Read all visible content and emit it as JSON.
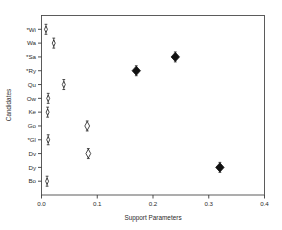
{
  "chart_data": {
    "type": "scatter",
    "title": "",
    "xlabel": "Support Parameters",
    "ylabel": "Candidates",
    "xlim": [
      0.0,
      0.4
    ],
    "grid": false,
    "legend": null,
    "xticks": [
      "0.0",
      "0.1",
      "0.2",
      "0.3",
      "0.4"
    ],
    "xtick_values": [
      0.0,
      0.1,
      0.2,
      0.3,
      0.4
    ],
    "categories": [
      "*Wi",
      "Wa",
      "*Sa",
      "*Ry",
      "Qu",
      "Ow",
      "Ke",
      "Go",
      "*Gl",
      "Dv",
      "Dy",
      "Bo"
    ],
    "points": [
      {
        "label": "*Wi",
        "value": 0.008,
        "low": 0.003,
        "high": 0.015,
        "marker": "open-small"
      },
      {
        "label": "Wa",
        "value": 0.022,
        "low": 0.016,
        "high": 0.03,
        "marker": "open-small"
      },
      {
        "label": "*Sa",
        "value": 0.24,
        "low": 0.232,
        "high": 0.249,
        "marker": "solid-diamond"
      },
      {
        "label": "*Ry",
        "value": 0.17,
        "low": 0.162,
        "high": 0.179,
        "marker": "solid-diamond"
      },
      {
        "label": "Qu",
        "value": 0.04,
        "low": 0.033,
        "high": 0.049,
        "marker": "open-small"
      },
      {
        "label": "Ow",
        "value": 0.012,
        "low": 0.006,
        "high": 0.019,
        "marker": "open-small"
      },
      {
        "label": "Ke",
        "value": 0.011,
        "low": 0.005,
        "high": 0.018,
        "marker": "open-small"
      },
      {
        "label": "Go",
        "value": 0.082,
        "low": 0.074,
        "high": 0.092,
        "marker": "open-diamond"
      },
      {
        "label": "*Gl",
        "value": 0.012,
        "low": 0.006,
        "high": 0.02,
        "marker": "open-small"
      },
      {
        "label": "Dv",
        "value": 0.084,
        "low": 0.076,
        "high": 0.093,
        "marker": "open-diamond"
      },
      {
        "label": "Dy",
        "value": 0.32,
        "low": 0.312,
        "high": 0.329,
        "marker": "solid-diamond"
      },
      {
        "label": "Bo",
        "value": 0.01,
        "low": 0.004,
        "high": 0.017,
        "marker": "open-small"
      }
    ],
    "colors": {
      "axis": "#3a3a3a",
      "frame": "#4a4a4a",
      "marker_solid": "#111111",
      "marker_open_fill": "#ffffff",
      "text": "#2b2b2b",
      "background": "#ffffff"
    }
  }
}
